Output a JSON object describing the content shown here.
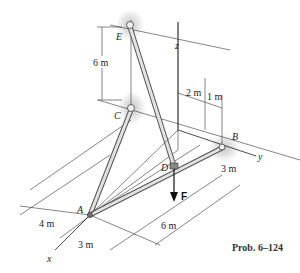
{
  "figure": {
    "caption": "Prob. 6–124",
    "points": {
      "A": "A",
      "B": "B",
      "C": "C",
      "D": "D",
      "E": "E"
    },
    "axes": {
      "x": "x",
      "y": "y",
      "z": "z"
    },
    "force": "F",
    "dimensions": {
      "ec_height": "6 m",
      "d_2m": "2 m",
      "d_1m": "1 m",
      "b_3m": "3 m",
      "a_4m": "4 m",
      "a_3m": "3 m",
      "ab_6m": "6 m"
    },
    "colors": {
      "member": "#d9d9d9",
      "member_edge": "#555555",
      "support_shadow": "#c8c8c8",
      "line": "#333333"
    }
  }
}
